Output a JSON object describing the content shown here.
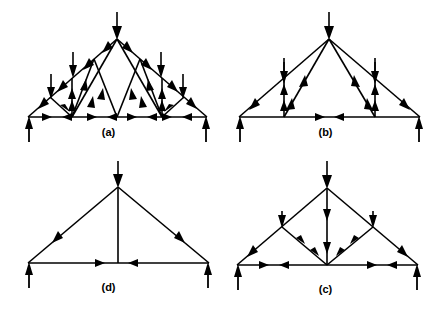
{
  "figure": {
    "background_color": "#ffffff",
    "ink_color": "#000000",
    "panel_count": 4,
    "panel_order": [
      "a",
      "b",
      "d",
      "c"
    ]
  },
  "panels": {
    "a": {
      "label": "(a)",
      "name": "fink-truss-full",
      "description": "Fink truss with five top-chord point loads and two support reactions",
      "top_chord_load_count": 5,
      "support_reaction_count": 2,
      "bottom_chord_arrow_count": 6,
      "panel_points_bottom": 5,
      "span_px": 179,
      "rise_px": 78
    },
    "b": {
      "label": "(b)",
      "name": "fink-truss-reduced-two-verticals",
      "description": "Truss with two loaded vertical members, apex load and two support reactions",
      "top_chord_load_count": 3,
      "support_reaction_count": 2,
      "bottom_chord_arrow_count": 2,
      "vertical_member_count": 2,
      "span_px": 181,
      "rise_px": 78
    },
    "c": {
      "label": "(c)",
      "name": "truss-w-bracing-central-vertical",
      "description": "Truss with central vertical carrying two arrows and W-shaped lower bracing, three loads, two reactions",
      "top_chord_load_count": 3,
      "support_reaction_count": 2,
      "bottom_chord_arrow_count": 4,
      "vertical_member_count": 1,
      "span_px": 181,
      "rise_px": 76
    },
    "d": {
      "label": "(d)",
      "name": "simple-triangle-truss",
      "description": "Simple triangular truss with apex load, central vertical and two support reactions",
      "top_chord_load_count": 1,
      "support_reaction_count": 2,
      "bottom_chord_arrow_count": 2,
      "vertical_member_count": 1,
      "span_px": 181,
      "rise_px": 76
    }
  },
  "legend": {
    "load_arrow": "downward-load-arrow",
    "reaction_arrow": "upward-reaction-arrow",
    "member_arrow": "member-force-direction-arrowhead"
  }
}
